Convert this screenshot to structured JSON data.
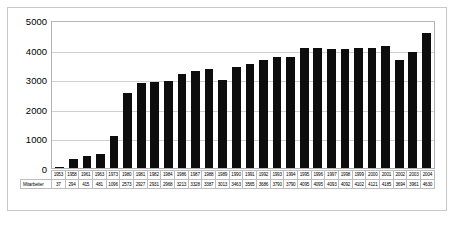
{
  "chart_data": {
    "type": "bar",
    "title": "",
    "xlabel": "",
    "ylabel": "",
    "ylim": [
      0,
      5000
    ],
    "grid": true,
    "legend": false,
    "series_label": "Mitarbeiter",
    "yticks": [
      5000,
      4000,
      3000,
      2000,
      1000,
      0
    ],
    "categories": [
      "1953",
      "1958",
      "1961",
      "1963",
      "1973",
      "1980",
      "1981",
      "1982",
      "1984",
      "1986",
      "1987",
      "1988",
      "1989",
      "1990",
      "1991",
      "1992",
      "1993",
      "1994",
      "1995",
      "1996",
      "1997",
      "1998",
      "1999",
      "2000",
      "2001",
      "2002",
      "2003",
      "2004"
    ],
    "values": [
      37,
      294,
      415,
      481,
      1096,
      2573,
      2927,
      2931,
      2968,
      3213,
      3328,
      3387,
      3013,
      3463,
      3565,
      3686,
      3790,
      3790,
      4095,
      4095,
      4093,
      4092,
      4102,
      4121,
      4185,
      3694,
      3961,
      4630
    ],
    "bar_color": "#0d0d0d",
    "grid_color": "#d0d0d0",
    "axis_color": "#b0b0b0"
  }
}
